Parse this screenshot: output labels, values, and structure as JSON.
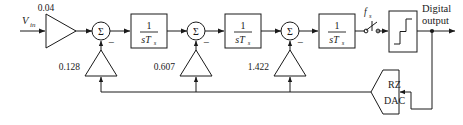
{
  "diagram": {
    "input": {
      "label_main": "V",
      "label_sub": "in"
    },
    "input_gain": {
      "value": "0.04",
      "icon": "triangle-right-amplifier"
    },
    "integrators": [
      {
        "numerator": "1",
        "den_main": "sT",
        "den_sub": "s"
      },
      {
        "numerator": "1",
        "den_main": "sT",
        "den_sub": "s"
      },
      {
        "numerator": "1",
        "den_main": "sT",
        "den_sub": "s"
      }
    ],
    "summers": [
      {
        "symbol": "Σ",
        "sign": "−"
      },
      {
        "symbol": "Σ",
        "sign": "−"
      },
      {
        "symbol": "Σ",
        "sign": "−"
      }
    ],
    "feedback_gains": [
      {
        "value": "0.128",
        "icon": "triangle-up-amplifier"
      },
      {
        "value": "0.607",
        "icon": "triangle-up-amplifier"
      },
      {
        "value": "1.422",
        "icon": "triangle-up-amplifier"
      }
    ],
    "sampler": {
      "label_main": "f",
      "label_sub": "s",
      "icon": "switch-sampler"
    },
    "quantizer": {
      "icon": "staircase-quantizer-icon"
    },
    "output": {
      "line1": "Digital",
      "line2": "output"
    },
    "dac": {
      "line1": "RZ",
      "line2": "DAC",
      "icon": "pentagon-dac-block"
    },
    "colors": {
      "line": "#1a1a1a",
      "fill": "#ffffff",
      "background": "#ffffff"
    }
  }
}
